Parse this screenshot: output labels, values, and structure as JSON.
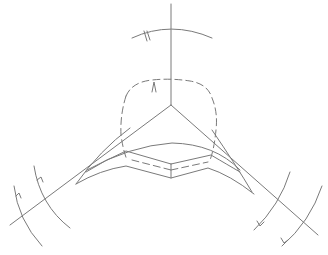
{
  "diagram": {
    "kind": "geometric line drawing (three-armed axis with arcs)",
    "colors": {
      "background": "#ffffff",
      "stroke": "#7a7a7a"
    },
    "center": [
      171,
      105
    ],
    "axes": [
      {
        "name": "vertical-axis",
        "from": [
          171,
          4
        ],
        "to": [
          171,
          105
        ]
      },
      {
        "name": "left-axis",
        "from": [
          171,
          105
        ],
        "to": [
          10,
          225
        ]
      },
      {
        "name": "right-axis",
        "from": [
          171,
          105
        ],
        "to": [
          318,
          235
        ]
      }
    ],
    "arcs": [
      {
        "name": "top-outer-arc",
        "arrow": "up"
      },
      {
        "name": "top-inner-dashed-arc",
        "arrow": "up"
      },
      {
        "name": "left-arc-inner",
        "arrow": "up-left"
      },
      {
        "name": "left-arc-outer",
        "arrow": "up-left"
      },
      {
        "name": "right-arc-inner",
        "arrow": "down-right"
      },
      {
        "name": "right-arc-outer",
        "arrow": "down-right"
      }
    ],
    "bands": [
      {
        "name": "upper-curved-band"
      },
      {
        "name": "middle-angled-band"
      },
      {
        "name": "lower-angled-band"
      }
    ]
  }
}
